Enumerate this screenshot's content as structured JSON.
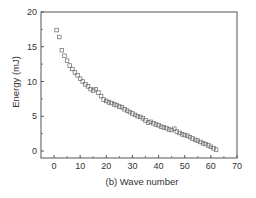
{
  "chart_data": {
    "type": "scatter",
    "title": "",
    "xlabel": "(b) Wave number",
    "ylabel": "Energy (mJ)",
    "xlim": [
      -5,
      70
    ],
    "ylim": [
      -1,
      20
    ],
    "xticks": [
      0,
      10,
      20,
      30,
      40,
      50,
      60,
      70
    ],
    "yticks": [
      0,
      5,
      10,
      15,
      20
    ],
    "grid": false,
    "legend": null,
    "marker": "open-square",
    "marker_color": "#666666",
    "series": [
      {
        "name": "Energy",
        "x": [
          1,
          2,
          3,
          4,
          5,
          6,
          7,
          8,
          9,
          10,
          11,
          12,
          13,
          14,
          15,
          16,
          17,
          18,
          19,
          20,
          21,
          22,
          23,
          24,
          25,
          26,
          27,
          28,
          29,
          30,
          31,
          32,
          33,
          34,
          35,
          36,
          37,
          38,
          39,
          40,
          41,
          42,
          43,
          44,
          45,
          46,
          47,
          48,
          49,
          50,
          51,
          52,
          53,
          54,
          55,
          56,
          57,
          58,
          59,
          60,
          61,
          62
        ],
        "values": [
          17.4,
          16.4,
          14.5,
          13.7,
          13.0,
          12.3,
          11.8,
          11.3,
          10.9,
          10.4,
          10.0,
          9.6,
          9.3,
          8.9,
          8.7,
          8.9,
          8.4,
          7.9,
          7.4,
          7.2,
          7.0,
          6.9,
          6.7,
          6.6,
          6.4,
          6.3,
          6.0,
          5.8,
          5.6,
          5.4,
          5.2,
          5.0,
          4.9,
          4.7,
          4.4,
          4.1,
          4.2,
          4.0,
          3.8,
          3.7,
          3.5,
          3.4,
          3.3,
          3.1,
          3.0,
          3.2,
          2.8,
          2.6,
          2.4,
          2.3,
          2.2,
          2.0,
          1.8,
          1.6,
          1.5,
          1.3,
          1.1,
          1.0,
          0.8,
          0.6,
          0.4,
          0.2
        ]
      }
    ]
  },
  "plot": {
    "xlabel": "(b) Wave number",
    "ylabel": "Energy (mJ)"
  }
}
